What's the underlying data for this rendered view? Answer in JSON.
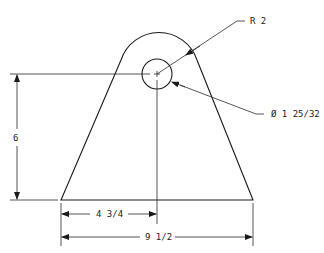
{
  "drawing": {
    "type": "mechanical tab / lug drawing",
    "colors": {
      "line": "#1a1a1a",
      "background": "#ffffff"
    },
    "dimensions": {
      "outer_radius": "R 2",
      "hole_diameter": "Ø 1 25/32",
      "height": "6",
      "half_width": "4 3/4",
      "base_width": "9 1/2"
    }
  }
}
